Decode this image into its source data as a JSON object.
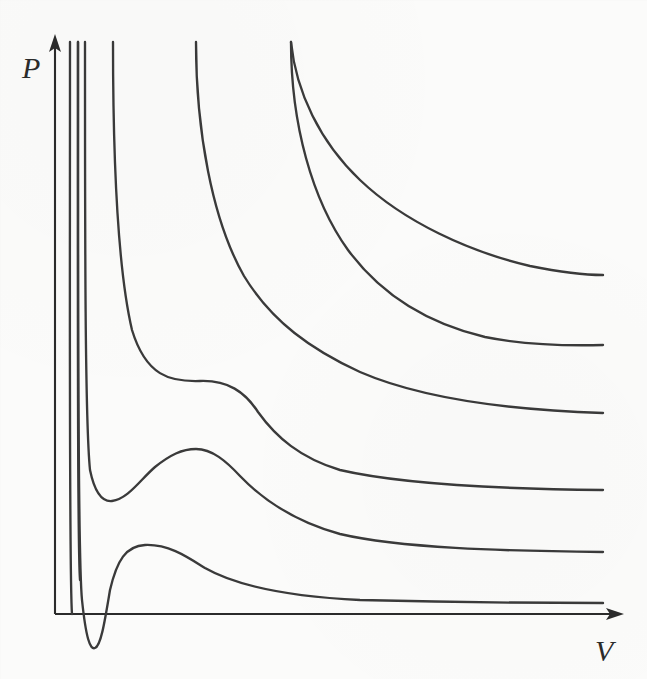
{
  "figure": {
    "kind": "pv-isotherm-diagram",
    "background_color": "#fbfbfa",
    "line_color": "#3a3a3a",
    "axis_color": "#2b2b2b",
    "axes": {
      "y_label": "P",
      "x_label": "V",
      "origin_px": [
        55,
        614
      ],
      "y_axis_top_px": 37,
      "x_axis_right_px": 620
    }
  },
  "chart_data": {
    "type": "line",
    "title": "",
    "subtitle": "",
    "xlabel": "V",
    "ylabel": "P",
    "xlim": [
      55,
      620
    ],
    "ylim": [
      679,
      37
    ],
    "grid": false,
    "legend": "none",
    "axis_ticks": {
      "x": [],
      "y": []
    },
    "annotations": [],
    "series": [
      {
        "name": "isotherm-1-lowest",
        "label": "",
        "kind": "subcritical",
        "start_px": [
          78,
          42
        ],
        "end_px": [
          603,
          603
        ],
        "local_min_px": [
          92,
          648
        ],
        "local_max_px": [
          145,
          545
        ],
        "crosses_axis": true,
        "path": "M78,42 C78,300 78,560 82,600 C86,638 90,650 95,648 C101,646 105,620 110,590 C117,560 126,546 145,545 C168,544 186,556 205,568 C240,588 300,597 360,600 C440,602 540,603 603,603"
      },
      {
        "name": "isotherm-2",
        "label": "",
        "kind": "subcritical",
        "start_px": [
          85,
          42
        ],
        "end_px": [
          603,
          552
        ],
        "local_min_px": [
          112,
          501
        ],
        "local_max_px": [
          196,
          449
        ],
        "crosses_axis": false,
        "path": "M85,42 C85,240 85,420 90,470 C95,494 103,502 112,501 C128,499 140,480 155,467 C170,455 182,449 196,449 C212,449 226,461 240,476 C268,505 300,523 340,534 C400,548 500,551 603,552"
      },
      {
        "name": "isotherm-3-critical",
        "label": "",
        "kind": "critical",
        "start_px": [
          113,
          42
        ],
        "end_px": [
          603,
          490
        ],
        "inflection_px": [
          215,
          383
        ],
        "crosses_axis": false,
        "path": "M113,42 C113,160 118,270 132,330 C146,376 170,382 200,381 C228,380 245,392 258,412 C276,437 300,458 340,470 C400,484 500,489 603,490"
      },
      {
        "name": "isotherm-4",
        "label": "",
        "kind": "supercritical",
        "start_px": [
          196,
          42
        ],
        "end_px": [
          603,
          413
        ],
        "crosses_axis": false,
        "path": "M196,42 C196,130 212,220 244,276 C272,322 312,350 360,372 C420,398 510,410 603,413"
      },
      {
        "name": "isotherm-5",
        "label": "",
        "kind": "supercritical",
        "start_px": [
          291,
          42
        ],
        "end_px": [
          603,
          345
        ],
        "crosses_axis": false,
        "path": "M291,42 C291,124 312,200 348,250 C382,296 430,324 485,337 C525,345 565,346 603,345"
      },
      {
        "name": "isotherm-6-highest",
        "label": "",
        "kind": "supercritical",
        "start_px": [
          291,
          42
        ],
        "end_px": [
          603,
          275
        ],
        "crosses_axis": false,
        "path": "M291,42 C296,92 320,142 360,180 C404,222 470,252 530,266 C560,272 583,275 603,275"
      }
    ],
    "near_vertical_asymptote_lines": [
      {
        "name": "asymptote-line-1",
        "x_px": 70,
        "top_px": 42,
        "bottom_px": 614
      },
      {
        "name": "asymptote-line-2",
        "x_px": 78,
        "top_px": 42,
        "bottom_px": 580
      }
    ]
  }
}
